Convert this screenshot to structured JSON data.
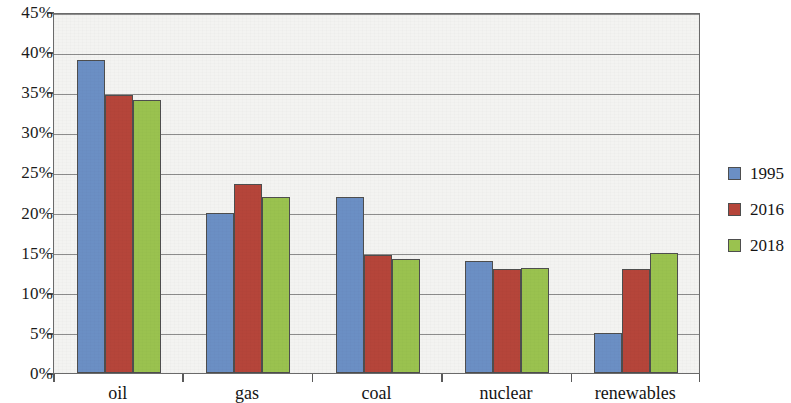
{
  "chart_data": {
    "type": "bar",
    "title": "",
    "xlabel": "",
    "ylabel": "",
    "categories": [
      "oil",
      "gas",
      "coal",
      "nuclear",
      "renewables"
    ],
    "series": [
      {
        "name": "1995",
        "color": "#6b8fc4",
        "values": [
          39,
          20,
          22,
          14,
          5
        ]
      },
      {
        "name": "2016",
        "color": "#b5453a",
        "values": [
          34.7,
          23.5,
          14.7,
          13,
          13
        ]
      },
      {
        "name": "2018",
        "color": "#9ac24f",
        "values": [
          34,
          22,
          14.2,
          13.1,
          15
        ]
      }
    ],
    "ylim": [
      0,
      45
    ],
    "ytick_values": [
      0,
      5,
      10,
      15,
      20,
      25,
      30,
      35,
      40,
      45
    ],
    "ytick_labels": [
      "0%",
      "5%",
      "10%",
      "15%",
      "20%",
      "25%",
      "30%",
      "35%",
      "40%",
      "45%"
    ],
    "grid": true,
    "legend_position": "right",
    "plot_background": "#f3f3f1",
    "gridline_color": "#8c8c8c",
    "axis_color": "#6a6a6a"
  }
}
